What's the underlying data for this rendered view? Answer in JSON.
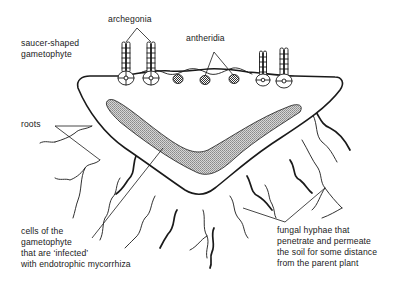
{
  "diagram": {
    "type": "labeled biological diagram",
    "colors": {
      "line": "#1a1a1a",
      "infected_region_fill": "#b8b8b8",
      "background": "#ffffff"
    },
    "labels": {
      "archegonia": "archegonia",
      "antheridia": "antheridia",
      "gametophyte_line1": "saucer-shaped",
      "gametophyte_line2": "gametophyte",
      "roots": "roots",
      "cells_line1": "cells of the",
      "cells_line2": "gametophyte",
      "cells_line3": "that are ‘infected’",
      "cells_line4": "with endotrophic mycorrhiza",
      "hyphae_line1": "fungal hyphae that",
      "hyphae_line2": "penetrate and permeate",
      "hyphae_line3": "the soil for some distance",
      "hyphae_line4": "from the parent plant"
    },
    "structures": {
      "archegonia_count": 4,
      "antheridia_count": 3
    }
  }
}
